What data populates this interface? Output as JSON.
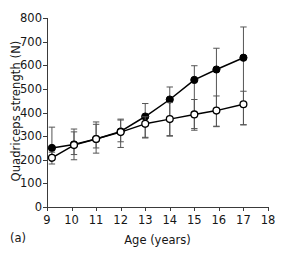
{
  "figure": {
    "panel_label": "(a)",
    "y_axis_title": "Quadriceps strength (N)",
    "x_axis_title": "Age (years)"
  },
  "chart_data": {
    "type": "line",
    "title": "",
    "subtitle": "",
    "xlabel": "Age (years)",
    "ylabel": "Quadriceps strength (N)",
    "xlim": [
      9,
      18
    ],
    "ylim": [
      0,
      800
    ],
    "xticks": [
      9,
      10,
      11,
      12,
      13,
      14,
      15,
      16,
      17,
      18
    ],
    "yticks": [
      0,
      100,
      200,
      300,
      400,
      500,
      600,
      700,
      800
    ],
    "xtick_labels": [
      "9",
      "10",
      "11",
      "12",
      "13",
      "14",
      "15",
      "16",
      "17",
      "18"
    ],
    "ytick_labels": [
      "0",
      "100",
      "200",
      "300",
      "400",
      "500",
      "600",
      "700",
      "800"
    ],
    "grid": false,
    "legend": null,
    "error_bars": "vertical",
    "marker_colors": {
      "filled": "#000000",
      "open": "#ffffff",
      "line": "#000000",
      "error": "#555555"
    },
    "series": [
      {
        "name": "filled-circles",
        "marker": "filled-circle",
        "x": [
          9.2,
          10.1,
          11.0,
          12.0,
          13.0,
          14.0,
          15.0,
          15.9,
          17.0
        ],
        "values": [
          250,
          265,
          288,
          320,
          383,
          455,
          538,
          582,
          632
        ],
        "err_low": [
          202,
          222,
          250,
          276,
          295,
          302,
          332,
          342,
          348
        ],
        "err_high": [
          338,
          330,
          360,
          368,
          438,
          508,
          598,
          672,
          762
        ]
      },
      {
        "name": "open-circles",
        "marker": "open-circle",
        "x": [
          9.2,
          10.1,
          11.0,
          12.0,
          13.0,
          14.0,
          15.0,
          15.9,
          17.0
        ],
        "values": [
          208,
          262,
          288,
          317,
          352,
          372,
          392,
          408,
          435
        ],
        "err_low": [
          182,
          200,
          228,
          252,
          292,
          300,
          325,
          340,
          348
        ],
        "err_high": [
          232,
          318,
          350,
          372,
          382,
          442,
          455,
          470,
          490
        ]
      }
    ]
  }
}
